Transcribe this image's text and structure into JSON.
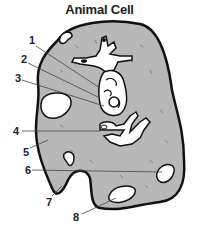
{
  "title": "Animal Cell",
  "labels": [
    {
      "n": "1",
      "x": 29,
      "y": 38
    },
    {
      "n": "2",
      "x": 21,
      "y": 57
    },
    {
      "n": "3",
      "x": 15,
      "y": 75
    },
    {
      "n": "4",
      "x": 13,
      "y": 126
    },
    {
      "n": "5",
      "x": 23,
      "y": 147
    },
    {
      "n": "6",
      "x": 25,
      "y": 163
    },
    {
      "n": "7",
      "x": 46,
      "y": 198
    },
    {
      "n": "8",
      "x": 73,
      "y": 211
    }
  ],
  "colors": {
    "cytoplasm": "#b8b8b8",
    "outline": "#111111",
    "organelle": "#ffffff",
    "leader": "#444444"
  }
}
